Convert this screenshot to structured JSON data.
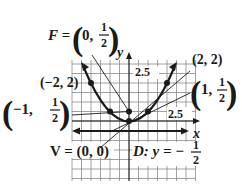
{
  "figure": {
    "type": "parabola-graph",
    "equation": "x^2 = 2y",
    "focus_label": "F =",
    "focus_x": "0,",
    "focus_y_num": "1",
    "focus_y_den": "2",
    "vertex_label": "V = (0, 0)",
    "directrix_label": "D: y = −",
    "directrix_num": "1",
    "directrix_den": "2",
    "axis_x_label": "x",
    "axis_y_label": "y",
    "tick_y": "2.5",
    "tick_x": "2.5",
    "points": [
      {
        "label": "(−2, 2)",
        "x": -2,
        "y": 2
      },
      {
        "label": "(2, 2)",
        "x": 2,
        "y": 2
      },
      {
        "label_prefix": "−1,",
        "num": "1",
        "den": "2",
        "x": -1,
        "y": 0.5
      },
      {
        "label_prefix": "1,",
        "num": "1",
        "den": "2",
        "x": 1,
        "y": 0.5
      }
    ],
    "colors": {
      "ink": "#1a1a1a",
      "grid": "#8a8a8a",
      "background": "#ffffff"
    }
  }
}
